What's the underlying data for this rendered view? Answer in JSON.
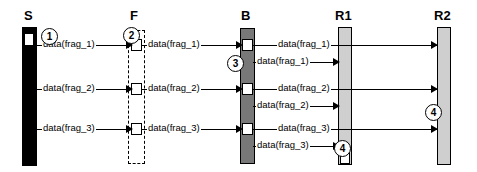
{
  "diagram": {
    "type": "sequence-diagram",
    "title": "",
    "colors": {
      "sender_bar": "#000000",
      "fragmenter_bar": "#ffffff",
      "bridge_bar": "#787878",
      "receiver_bar": "#cfcfcf",
      "stroke": "#000000",
      "background": "#ffffff"
    },
    "lifelines": [
      {
        "id": "S",
        "label": "S",
        "style": "solid-black",
        "x": 22,
        "width": 15
      },
      {
        "id": "F",
        "label": "F",
        "style": "dashed-open",
        "x": 128,
        "width": 17
      },
      {
        "id": "B",
        "label": "B",
        "style": "solid-dark",
        "x": 240,
        "width": 15
      },
      {
        "id": "R1",
        "label": "R1",
        "style": "solid-light",
        "x": 338,
        "width": 14
      },
      {
        "id": "R2",
        "label": "R2",
        "style": "solid-light",
        "x": 437,
        "width": 14
      }
    ],
    "messages": [
      {
        "from": "S",
        "to": "F",
        "label": "data(frag_1)",
        "y": 45
      },
      {
        "from": "F",
        "to": "B",
        "label": "data(frag_1)",
        "y": 45
      },
      {
        "from": "B",
        "to": "R2",
        "label": "data(frag_1)",
        "y": 45
      },
      {
        "from": "B",
        "to": "R1",
        "label": "data(frag_1)",
        "y": 62
      },
      {
        "from": "S",
        "to": "F",
        "label": "data(frag_2)",
        "y": 89
      },
      {
        "from": "F",
        "to": "B",
        "label": "data(frag_2)",
        "y": 89
      },
      {
        "from": "B",
        "to": "R2",
        "label": "data(frag_2)",
        "y": 89
      },
      {
        "from": "B",
        "to": "R1",
        "label": "data(frag_2)",
        "y": 106
      },
      {
        "from": "S",
        "to": "F",
        "label": "data(frag_3)",
        "y": 129
      },
      {
        "from": "F",
        "to": "B",
        "label": "data(frag_3)",
        "y": 129
      },
      {
        "from": "B",
        "to": "R2",
        "label": "data(frag_3)",
        "y": 129
      },
      {
        "from": "B",
        "to": "R1",
        "label": "data(frag_3)",
        "y": 146
      }
    ],
    "callouts": [
      {
        "number": "1",
        "x": 41,
        "y": 28
      },
      {
        "number": "2",
        "x": 123,
        "y": 27
      },
      {
        "number": "3",
        "x": 227,
        "y": 55
      },
      {
        "number": "4",
        "x": 334,
        "y": 140
      },
      {
        "number": "4",
        "x": 425,
        "y": 104
      }
    ]
  }
}
